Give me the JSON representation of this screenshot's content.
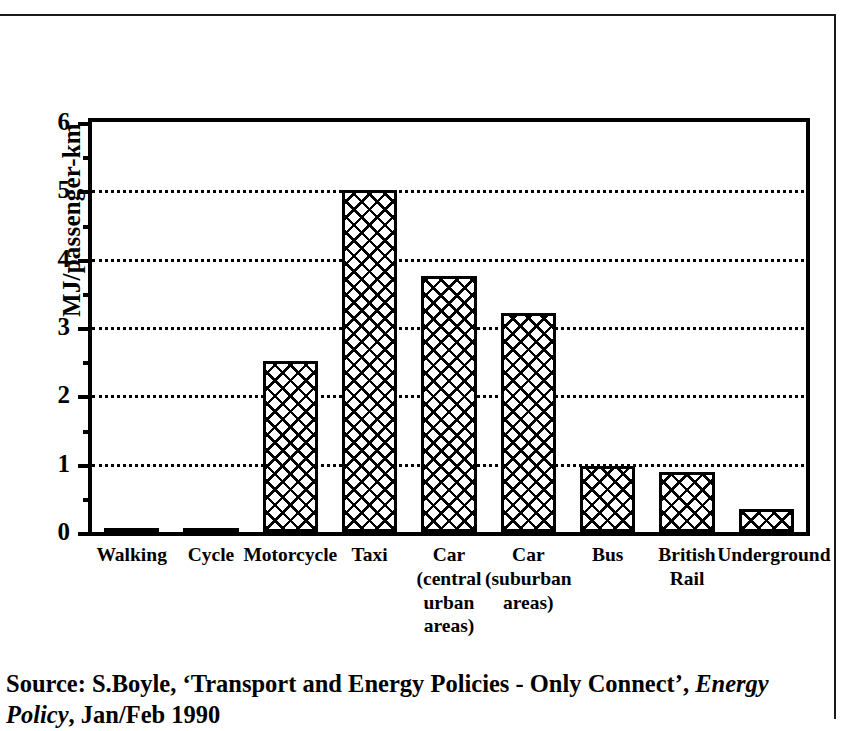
{
  "figure": {
    "source_prefix": "Source: S.Boyle, ‘Transport and Energy Policies - Only Connect’,",
    "source_journal": "Energy",
    "source_journal_cont": "Policy",
    "source_suffix": ", Jan/Feb 1990"
  },
  "chart_data": {
    "type": "bar",
    "title": "",
    "xlabel": "",
    "ylabel": "MJ/passenger-km",
    "ylim": [
      0,
      6
    ],
    "ytick_labels": [
      "0",
      "1",
      "2",
      "3",
      "4",
      "5",
      "6"
    ],
    "ytick_values": [
      0,
      1,
      2,
      3,
      4,
      5,
      6
    ],
    "yminor_values": [
      0.5,
      1.5,
      2.5,
      3.5,
      4.5,
      5.5
    ],
    "gridlines_at": [
      1,
      2,
      3,
      4,
      5
    ],
    "grid": true,
    "legend": "none",
    "bar_fill": "crosshatch",
    "categories": [
      "Walking",
      "Cycle",
      "Motorcycle",
      "Taxi",
      "Car\n(central\nurban\nareas)",
      "Car\n(suburban\nareas)",
      "Bus",
      "British\nRail",
      "Underground"
    ],
    "category_labels": [
      [
        "Walking"
      ],
      [
        "Cycle"
      ],
      [
        "Motorcycle"
      ],
      [
        "Taxi"
      ],
      [
        "Car",
        "(central",
        "urban",
        "areas)"
      ],
      [
        "Car",
        "(suburban",
        "areas)"
      ],
      [
        "Bus"
      ],
      [
        "British",
        "Rail"
      ],
      [
        "Underground"
      ]
    ],
    "values": [
      0.04,
      0.04,
      2.5,
      5.0,
      3.75,
      3.2,
      0.97,
      0.88,
      0.33
    ],
    "colors": {
      "bar_outline": "#000000",
      "bar_face": "#ffffff",
      "axis": "#000000",
      "grid": "#000000"
    }
  }
}
